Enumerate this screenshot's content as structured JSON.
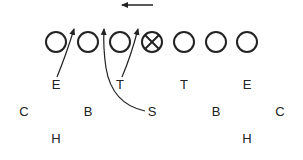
{
  "diagram": {
    "type": "football-play-diagram",
    "colors": {
      "line": "#222222",
      "background": "#ffffff"
    },
    "motion_arrow": {
      "direction": "left",
      "x1": 153,
      "x2": 118,
      "y": 5
    },
    "offense": [
      {
        "id": "o1",
        "x": 56,
        "y": 42,
        "symbol": "circle"
      },
      {
        "id": "o2",
        "x": 88,
        "y": 42,
        "symbol": "circle"
      },
      {
        "id": "o3",
        "x": 120,
        "y": 42,
        "symbol": "circle"
      },
      {
        "id": "o4",
        "x": 152,
        "y": 42,
        "symbol": "crossed-circle",
        "role": "center"
      },
      {
        "id": "o5",
        "x": 184,
        "y": 42,
        "symbol": "circle"
      },
      {
        "id": "o6",
        "x": 216,
        "y": 42,
        "symbol": "circle"
      },
      {
        "id": "o7",
        "x": 247,
        "y": 42,
        "symbol": "circle"
      }
    ],
    "defense": [
      {
        "label": "E",
        "x": 56,
        "y": 84
      },
      {
        "label": "T",
        "x": 120,
        "y": 84
      },
      {
        "label": "T",
        "x": 184,
        "y": 84
      },
      {
        "label": "E",
        "x": 247,
        "y": 84
      },
      {
        "label": "C",
        "x": 24,
        "y": 111
      },
      {
        "label": "B",
        "x": 88,
        "y": 111
      },
      {
        "label": "S",
        "x": 152,
        "y": 111
      },
      {
        "label": "B",
        "x": 216,
        "y": 111
      },
      {
        "label": "C",
        "x": 280,
        "y": 111
      },
      {
        "label": "H",
        "x": 56,
        "y": 138
      },
      {
        "label": "H",
        "x": 247,
        "y": 138
      }
    ],
    "routes": [
      {
        "from": "E",
        "path": "M57,77 Q66,55 74,29"
      },
      {
        "from": "S",
        "path": "M145,111 Q112,104 106,68 Q103,48 104,29"
      },
      {
        "from": "T",
        "path": "M122,77 Q131,56 138,29"
      }
    ]
  }
}
